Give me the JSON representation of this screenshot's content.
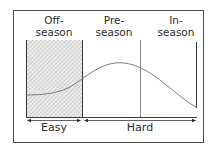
{
  "diagram": {
    "phases": [
      {
        "id": "off",
        "line1": "Off-",
        "line2": "season"
      },
      {
        "id": "pre",
        "line1": "Pre-",
        "line2": "season"
      },
      {
        "id": "in",
        "line1": "In-",
        "line2": "season"
      }
    ],
    "intensity_labels": {
      "easy": "Easy",
      "hard": "Hard"
    },
    "colors": {
      "line": "#3a3a3a",
      "frame": "#4a4a4a",
      "hatch": "#9a9a9a",
      "hatch_bg": "#f2f2f2",
      "background": "#ffffff"
    },
    "curve_description": "Training intensity curve: low and flat in off-season, rising through pre-season to a peak, then declining through in-season"
  }
}
